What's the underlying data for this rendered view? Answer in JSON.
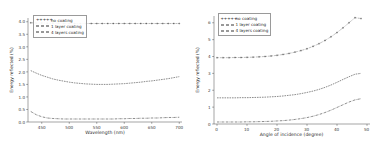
{
  "figure": {
    "panel_count": 2,
    "background": "#ffffff",
    "line_color": "#2e2e2e"
  },
  "chart_data": [
    {
      "type": "line",
      "title": "",
      "xlabel": "Wavelength (nm)",
      "ylabel": "Energy reflected (%)",
      "xlim": [
        425,
        705
      ],
      "ylim": [
        0.0,
        4.15
      ],
      "xticks": [
        450,
        500,
        550,
        600,
        650,
        700
      ],
      "yticks": [
        0.0,
        0.5,
        1.0,
        1.5,
        2.0,
        2.5,
        3.0,
        3.5,
        4.0
      ],
      "xticklabels": [
        "450",
        "500",
        "550",
        "600",
        "650",
        "700"
      ],
      "yticklabels": [
        "0.0",
        "0.5",
        "1.0",
        "1.5",
        "2.0",
        "2.5",
        "3.0",
        "3.5",
        "4.0"
      ],
      "grid": false,
      "legend_position": "upper left",
      "legend": [
        "no coating",
        "1 layer coating",
        "4 layers coating"
      ],
      "x": [
        430,
        440,
        450,
        460,
        470,
        480,
        490,
        500,
        510,
        520,
        530,
        540,
        550,
        560,
        570,
        580,
        590,
        600,
        610,
        620,
        630,
        640,
        650,
        660,
        670,
        680,
        690,
        700
      ],
      "series": [
        {
          "name": "no coating",
          "style": "dotted-marker",
          "values": [
            3.96,
            3.95,
            3.95,
            3.94,
            3.94,
            3.94,
            3.93,
            3.93,
            3.93,
            3.93,
            3.93,
            3.93,
            3.93,
            3.93,
            3.93,
            3.93,
            3.93,
            3.93,
            3.93,
            3.93,
            3.93,
            3.93,
            3.93,
            3.93,
            3.93,
            3.93,
            3.93,
            3.93
          ]
        },
        {
          "name": "1 layer coating",
          "style": "dashed",
          "values": [
            2.05,
            1.95,
            1.86,
            1.79,
            1.72,
            1.67,
            1.63,
            1.59,
            1.56,
            1.54,
            1.52,
            1.51,
            1.5,
            1.5,
            1.5,
            1.51,
            1.52,
            1.53,
            1.55,
            1.57,
            1.59,
            1.62,
            1.64,
            1.67,
            1.7,
            1.73,
            1.77,
            1.81
          ]
        },
        {
          "name": "4 layers coating",
          "style": "dash-dot",
          "values": [
            0.42,
            0.29,
            0.21,
            0.16,
            0.14,
            0.13,
            0.12,
            0.12,
            0.12,
            0.12,
            0.12,
            0.12,
            0.12,
            0.12,
            0.12,
            0.12,
            0.13,
            0.13,
            0.14,
            0.14,
            0.15,
            0.15,
            0.16,
            0.16,
            0.17,
            0.18,
            0.18,
            0.19
          ]
        }
      ]
    },
    {
      "type": "line",
      "title": "",
      "xlabel": "Angle of incidence (degree)",
      "ylabel": "Energy reflected (%)",
      "xlim": [
        -1,
        51
      ],
      "ylim": [
        0,
        6.4
      ],
      "xticks": [
        0,
        10,
        20,
        30,
        40,
        50
      ],
      "yticks": [
        0,
        1,
        2,
        3,
        4,
        5,
        6
      ],
      "xticklabels": [
        "0",
        "10",
        "20",
        "30",
        "40",
        "50"
      ],
      "yticklabels": [
        "0",
        "1",
        "2",
        "3",
        "4",
        "5",
        "6"
      ],
      "grid": false,
      "legend_position": "upper left",
      "legend": [
        "no coating",
        "1 layer coating",
        "4 layers coating"
      ],
      "x": [
        0,
        2,
        4,
        6,
        8,
        10,
        12,
        14,
        16,
        18,
        20,
        22,
        24,
        26,
        28,
        30,
        32,
        34,
        36,
        38,
        40,
        42,
        44,
        46,
        48
      ],
      "series": [
        {
          "name": "no coating",
          "style": "dotted-marker",
          "values": [
            3.93,
            3.93,
            3.93,
            3.94,
            3.94,
            3.95,
            3.96,
            3.98,
            4.0,
            4.03,
            4.07,
            4.12,
            4.18,
            4.26,
            4.35,
            4.46,
            4.6,
            4.76,
            4.95,
            5.17,
            5.42,
            5.7,
            6.0,
            6.3,
            6.25
          ]
        },
        {
          "name": "1 layer coating",
          "style": "dashed",
          "values": [
            1.55,
            1.55,
            1.55,
            1.55,
            1.56,
            1.56,
            1.57,
            1.58,
            1.59,
            1.61,
            1.63,
            1.66,
            1.7,
            1.74,
            1.8,
            1.87,
            1.95,
            2.05,
            2.17,
            2.31,
            2.47,
            2.64,
            2.8,
            2.95,
            3.0
          ]
        },
        {
          "name": "4 layers coating",
          "style": "dash-dot",
          "values": [
            0.12,
            0.12,
            0.12,
            0.12,
            0.12,
            0.13,
            0.13,
            0.14,
            0.15,
            0.16,
            0.18,
            0.2,
            0.23,
            0.27,
            0.32,
            0.38,
            0.46,
            0.56,
            0.68,
            0.82,
            0.98,
            1.14,
            1.3,
            1.43,
            1.5
          ]
        }
      ]
    }
  ]
}
